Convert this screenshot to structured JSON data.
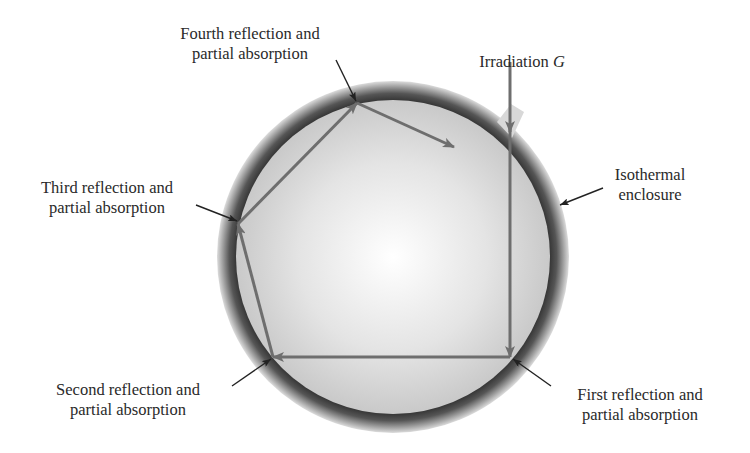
{
  "figure": {
    "colors": {
      "background": "#ffffff",
      "enclosure_wall_dark": "#3a3a3a",
      "enclosure_interior_center": "#ffffff",
      "enclosure_interior_edge": "#c8c8c8",
      "ray_color": "#6e6e6e",
      "leader_color": "#222222",
      "text_color": "#2a2a2a"
    }
  },
  "labels": {
    "irradiation": {
      "text": "Irradiation",
      "symbol": "G"
    },
    "enclosure": {
      "line1": "Isothermal",
      "line2": "enclosure"
    },
    "first": {
      "line1": "First reflection and",
      "line2": "partial absorption"
    },
    "second": {
      "line1": "Second reflection and",
      "line2": "partial absorption"
    },
    "third": {
      "line1": "Third reflection and",
      "line2": "partial absorption"
    },
    "fourth": {
      "line1": "Fourth reflection and",
      "line2": "partial absorption"
    }
  }
}
